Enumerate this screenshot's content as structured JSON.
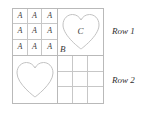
{
  "figure": {
    "line_color": "#b9b9b9",
    "inner_line_color": "#c7c7c7",
    "background": "#ffffff",
    "text_color": "#3a3a3a",
    "quadrants": {
      "top_left": {
        "type": "grid",
        "rows": 3,
        "cols": 3,
        "cells": [
          "A",
          "A",
          "A",
          "A",
          "A",
          "A",
          "A",
          "A",
          "A"
        ]
      },
      "top_right": {
        "type": "shape",
        "shape": "heart",
        "center_label": "C",
        "corner_label": "B"
      },
      "bottom_left": {
        "type": "shape",
        "shape": "heart",
        "center_label": "",
        "corner_label": ""
      },
      "bottom_right": {
        "type": "grid",
        "rows": 3,
        "cols": 3,
        "cells": [
          "",
          "",
          "",
          "",
          "",
          "",
          "",
          "",
          ""
        ]
      }
    }
  },
  "labels": {
    "row1": "Row 1",
    "row2": "Row 2"
  }
}
